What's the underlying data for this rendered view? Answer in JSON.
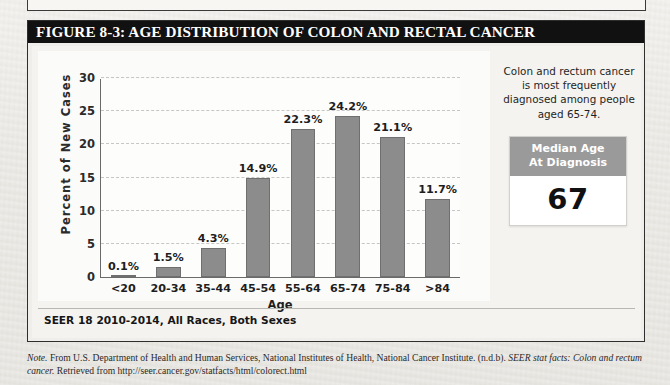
{
  "figure": {
    "title": "FIGURE 8-3: AGE DISTRIBUTION OF COLON AND RECTAL CANCER",
    "source_line": "SEER 18 2010-2014, All Races, Both Sexes"
  },
  "side_panel": {
    "callout": "Colon and rectum cancer is most frequently diagnosed among people aged 65-74.",
    "median_box": {
      "header_line1": "Median Age",
      "header_line2": "At Diagnosis",
      "value": "67"
    }
  },
  "note": {
    "label": "Note.",
    "text_part1": " From U.S. Department of Health and Human Services, National Institutes of Health, National Cancer Institute. (n.d.b). ",
    "italic_title": "SEER stat facts: Colon and rectum cancer.",
    "text_part2": " Retrieved from http://seer.cancer.gov/statfacts/html/colorect.html"
  },
  "colors": {
    "bar_fill": "#8c8c8c",
    "bar_stroke": "#6f6f6f",
    "title_bar": "#111111",
    "median_header": "#9a9a9a",
    "grid": "#c6c6c6"
  },
  "chart_data": {
    "type": "bar",
    "title": "",
    "xlabel": "Age",
    "ylabel": "Percent of New Cases",
    "categories": [
      "<20",
      "20-34",
      "35-44",
      "45-54",
      "55-64",
      "65-74",
      "75-84",
      ">84"
    ],
    "values": [
      0.1,
      1.5,
      4.3,
      14.9,
      22.3,
      24.2,
      21.1,
      11.7
    ],
    "data_labels": [
      "0.1%",
      "1.5%",
      "4.3%",
      "14.9%",
      "22.3%",
      "24.2%",
      "21.1%",
      "11.7%"
    ],
    "ylim": [
      0,
      30
    ],
    "yticks": [
      0,
      5,
      10,
      15,
      20,
      25,
      30
    ],
    "ytick_labels": [
      "0",
      "5",
      "10",
      "15",
      "20",
      "25",
      "30"
    ],
    "grid": "horizontal-dashed",
    "legend": "none"
  }
}
